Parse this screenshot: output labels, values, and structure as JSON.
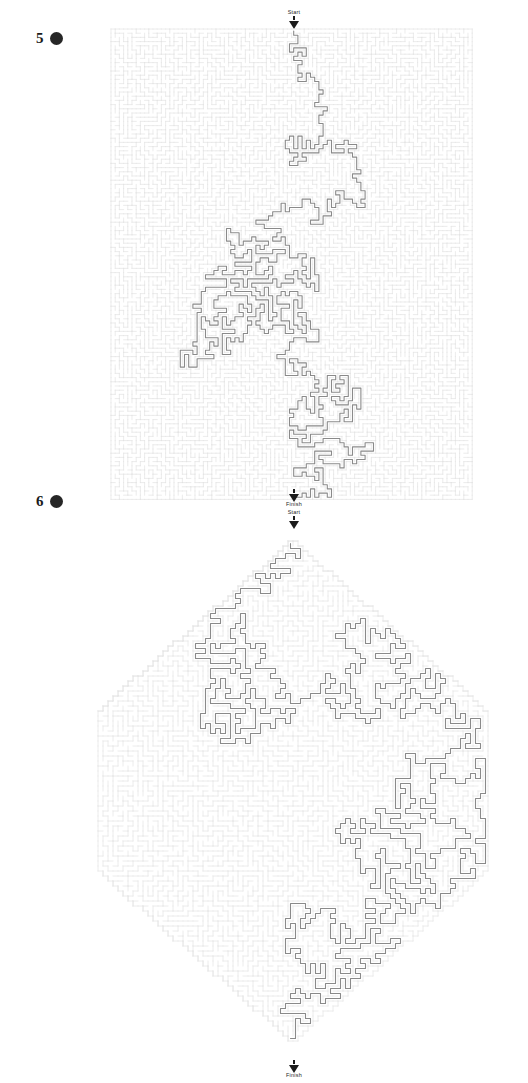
{
  "page": {
    "background": "#ffffff",
    "width": 528,
    "height": 1083
  },
  "style": {
    "wall_color": "#e2e2e2",
    "solution_color": "#8a8a8a",
    "marker_color": "#262626",
    "label_color": "#1f1f1f"
  },
  "puzzles": [
    {
      "index_number": "5",
      "shape": "rectangle",
      "start_label": "Start",
      "finish_label": "Finish",
      "frame": {
        "x": 110,
        "y": 28,
        "width": 363,
        "height": 470
      },
      "grid": {
        "cell": 4.2,
        "cols": 86,
        "rows": 112
      },
      "index_marker": {
        "x": 36,
        "y": 31
      },
      "start_marker": {
        "x": 264,
        "y": 10
      },
      "finish_marker": {
        "x": 264,
        "y": 489
      }
    },
    {
      "index_number": "6",
      "shape": "hexagon",
      "start_label": "Start",
      "finish_label": "Finish",
      "frame": {
        "x": 97,
        "y": 535,
        "width": 390,
        "height": 510
      },
      "hexagon": {
        "center_x": 292,
        "top_y": 535,
        "bottom_y": 1045,
        "left_x": 97,
        "right_x": 487,
        "upper_corner_y": 707,
        "lower_corner_y": 873
      },
      "grid": {
        "cell": 5.0,
        "cols": 78,
        "rows": 102
      },
      "index_marker": {
        "x": 36,
        "y": 494
      },
      "start_marker": {
        "x": 264,
        "y": 510
      },
      "finish_marker": {
        "x": 264,
        "y": 1060
      }
    }
  ],
  "chart_data": {
    "type": "diagram",
    "title": "",
    "subtitle": "",
    "diagram_kind": "maze-puzzle-sheet",
    "items": [
      {
        "id": 5,
        "label": "5",
        "maze_shape": "rectangle",
        "entrance": "Start",
        "entrance_position": "top-center",
        "exit": "Finish",
        "exit_position": "bottom-center",
        "solution_shown": true,
        "approx_cells_x": 86,
        "approx_cells_y": 112
      },
      {
        "id": 6,
        "label": "6",
        "maze_shape": "hexagon",
        "entrance": "Start",
        "entrance_position": "top-vertex",
        "exit": "Finish",
        "exit_position": "bottom-vertex",
        "solution_shown": true,
        "approx_cells_x": 78,
        "approx_cells_y": 102
      }
    ]
  }
}
